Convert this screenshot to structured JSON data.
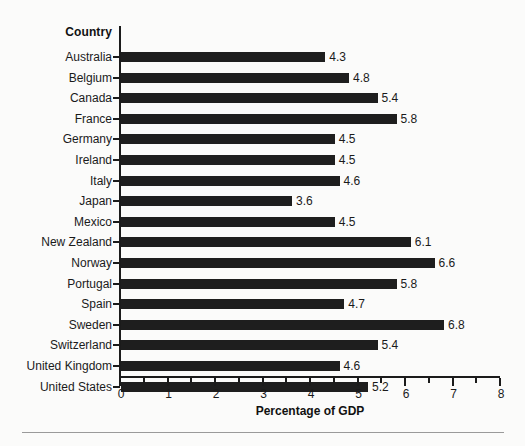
{
  "chart_data": {
    "type": "bar",
    "orientation": "horizontal",
    "title": "",
    "category_axis_title": "Country",
    "xlabel": "Percentage of GDP",
    "ylabel": "Country",
    "xlim": [
      0,
      8
    ],
    "xticks": [
      "0",
      "1",
      "2",
      "3",
      "4",
      "5",
      "6",
      "7",
      "8"
    ],
    "minor_tick_interval": 0.5,
    "grid": false,
    "legend": false,
    "bar_color": "#1e1e1e",
    "categories": [
      "Australia",
      "Belgium",
      "Canada",
      "France",
      "Germany",
      "Ireland",
      "Italy",
      "Japan",
      "Mexico",
      "New Zealand",
      "Norway",
      "Portugal",
      "Spain",
      "Sweden",
      "Switzerland",
      "United Kingdom",
      "United States"
    ],
    "values": [
      4.3,
      4.8,
      5.4,
      5.8,
      4.5,
      4.5,
      4.6,
      3.6,
      4.5,
      6.1,
      6.6,
      5.8,
      4.7,
      6.8,
      5.4,
      4.6,
      5.2
    ],
    "value_labels": [
      "4.3",
      "4.8",
      "5.4",
      "5.8",
      "4.5",
      "4.5",
      "4.6",
      "3.6",
      "4.5",
      "6.1",
      "6.6",
      "5.8",
      "4.7",
      "6.8",
      "5.4",
      "4.6",
      "5.2"
    ]
  }
}
